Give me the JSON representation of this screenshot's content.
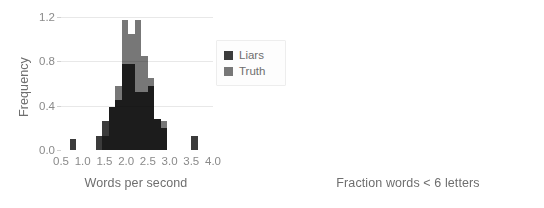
{
  "figure": {
    "background": "#ffffff",
    "legend": {
      "position": "center-right-of-left-panel",
      "entries": [
        {
          "label": "Liars",
          "color": "#3b3b3b"
        },
        {
          "label": "Truth",
          "color": "#777777"
        }
      ]
    }
  },
  "chart_data": [
    {
      "type": "bar",
      "subtype": "histogram-overlay",
      "panel": "left",
      "title": "",
      "xlabel": "Words per second",
      "ylabel": "Frequency",
      "xlim": [
        0.5,
        4.0
      ],
      "ylim": [
        0.0,
        1.2
      ],
      "xticks": [
        "0.5",
        "1.0",
        "1.5",
        "2.0",
        "2.5",
        "3.0",
        "3.5",
        "4.0"
      ],
      "xtick_values": [
        0.5,
        1.0,
        1.5,
        2.0,
        2.5,
        3.0,
        3.5,
        4.0
      ],
      "yticks": [
        "0.0",
        "0.4",
        "0.8",
        "1.2"
      ],
      "ytick_values": [
        0.0,
        0.4,
        0.8,
        1.2
      ],
      "grid": "horizontal",
      "bin_width": 0.15,
      "bin_edges": [
        0.7,
        0.85,
        1.3,
        1.45,
        1.6,
        1.75,
        1.9,
        2.05,
        2.2,
        2.35,
        2.5,
        2.65,
        2.8,
        2.95,
        3.5,
        3.65
      ],
      "series": [
        {
          "name": "Liars",
          "color": "#3b3b3b",
          "bins": [
            {
              "x0": 0.7,
              "x1": 0.85,
              "value": 0.1
            },
            {
              "x0": 1.3,
              "x1": 1.45,
              "value": 0.13
            },
            {
              "x0": 1.45,
              "x1": 1.6,
              "value": 0.26
            },
            {
              "x0": 1.6,
              "x1": 1.75,
              "value": 0.39
            },
            {
              "x0": 1.75,
              "x1": 1.9,
              "value": 0.45
            },
            {
              "x0": 1.9,
              "x1": 2.05,
              "value": 0.78
            },
            {
              "x0": 2.05,
              "x1": 2.2,
              "value": 0.78
            },
            {
              "x0": 2.2,
              "x1": 2.35,
              "value": 0.52
            },
            {
              "x0": 2.35,
              "x1": 2.5,
              "value": 0.52
            },
            {
              "x0": 2.5,
              "x1": 2.65,
              "value": 0.58
            },
            {
              "x0": 2.65,
              "x1": 2.8,
              "value": 0.28
            },
            {
              "x0": 2.8,
              "x1": 2.95,
              "value": 0.2
            },
            {
              "x0": 3.5,
              "x1": 3.65,
              "value": 0.13
            }
          ]
        },
        {
          "name": "Truth",
          "color": "#777777",
          "bins": [
            {
              "x0": 1.45,
              "x1": 1.6,
              "value": 0.13
            },
            {
              "x0": 1.6,
              "x1": 1.75,
              "value": 0.39
            },
            {
              "x0": 1.75,
              "x1": 1.9,
              "value": 0.58
            },
            {
              "x0": 1.9,
              "x1": 2.05,
              "value": 1.17
            },
            {
              "x0": 2.05,
              "x1": 2.2,
              "value": 1.05
            },
            {
              "x0": 2.2,
              "x1": 2.35,
              "value": 1.17
            },
            {
              "x0": 2.35,
              "x1": 2.5,
              "value": 0.85
            },
            {
              "x0": 2.5,
              "x1": 2.65,
              "value": 0.65
            },
            {
              "x0": 2.65,
              "x1": 2.8,
              "value": 0.28
            },
            {
              "x0": 2.8,
              "x1": 2.95,
              "value": 0.26
            }
          ]
        }
      ]
    },
    {
      "type": "bar",
      "subtype": "histogram-overlay",
      "panel": "right",
      "title": "",
      "xlabel": "Fraction words < 6 letters",
      "ylabel": "",
      "xlim": [
        0.05,
        0.25
      ],
      "ylim": [
        0,
        30
      ],
      "xticks": [
        "0.05",
        "0.10",
        "0.15",
        "0.20",
        "0.25"
      ],
      "xtick_values": [
        0.05,
        0.1,
        0.15,
        0.2,
        0.25
      ],
      "yticks": [
        "0",
        "10",
        "20",
        "30"
      ],
      "ytick_values": [
        0,
        10,
        20,
        30
      ],
      "grid": "horizontal",
      "bin_width": 0.0075,
      "series": [
        {
          "name": "Liars",
          "color": "#3b3b3b",
          "bins": [
            {
              "x0": 0.095,
              "x1": 0.1025,
              "value": 2
            },
            {
              "x0": 0.1025,
              "x1": 0.11,
              "value": 2
            },
            {
              "x0": 0.11,
              "x1": 0.1175,
              "value": 3
            },
            {
              "x0": 0.1175,
              "x1": 0.125,
              "value": 3
            },
            {
              "x0": 0.125,
              "x1": 0.1325,
              "value": 4
            },
            {
              "x0": 0.1325,
              "x1": 0.14,
              "value": 13
            },
            {
              "x0": 0.14,
              "x1": 0.1475,
              "value": 8
            },
            {
              "x0": 0.1475,
              "x1": 0.155,
              "value": 8
            },
            {
              "x0": 0.155,
              "x1": 0.1625,
              "value": 18
            },
            {
              "x0": 0.1625,
              "x1": 0.17,
              "value": 9
            },
            {
              "x0": 0.17,
              "x1": 0.1775,
              "value": 8
            },
            {
              "x0": 0.1775,
              "x1": 0.185,
              "value": 8
            },
            {
              "x0": 0.185,
              "x1": 0.1925,
              "value": 4
            },
            {
              "x0": 0.1925,
              "x1": 0.2,
              "value": 3
            },
            {
              "x0": 0.2,
              "x1": 0.2075,
              "value": 3
            },
            {
              "x0": 0.2075,
              "x1": 0.215,
              "value": 2
            }
          ]
        },
        {
          "name": "Truth",
          "color": "#777777",
          "bins": [
            {
              "x0": 0.095,
              "x1": 0.1025,
              "value": 2
            },
            {
              "x0": 0.1025,
              "x1": 0.11,
              "value": 5
            },
            {
              "x0": 0.11,
              "x1": 0.1175,
              "value": 10
            },
            {
              "x0": 0.1175,
              "x1": 0.125,
              "value": 6
            },
            {
              "x0": 0.125,
              "x1": 0.1325,
              "value": 16
            },
            {
              "x0": 0.1325,
              "x1": 0.14,
              "value": 16
            },
            {
              "x0": 0.14,
              "x1": 0.1475,
              "value": 4
            },
            {
              "x0": 0.1475,
              "x1": 0.155,
              "value": 8
            },
            {
              "x0": 0.155,
              "x1": 0.1625,
              "value": 24
            },
            {
              "x0": 0.1625,
              "x1": 0.17,
              "value": 27
            },
            {
              "x0": 0.17,
              "x1": 0.1775,
              "value": 16
            },
            {
              "x0": 0.1775,
              "x1": 0.185,
              "value": 8
            },
            {
              "x0": 0.185,
              "x1": 0.1925,
              "value": 4
            },
            {
              "x0": 0.1925,
              "x1": 0.2,
              "value": 4
            },
            {
              "x0": 0.2,
              "x1": 0.2075,
              "value": 3
            },
            {
              "x0": 0.2075,
              "x1": 0.215,
              "value": 2
            }
          ]
        }
      ]
    }
  ]
}
